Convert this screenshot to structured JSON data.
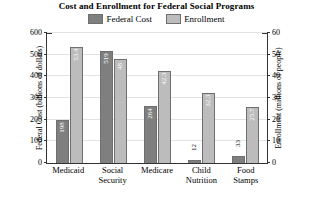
{
  "chart_data": {
    "type": "bar",
    "title": "Cost and Enrollment for Federal Social Programs",
    "categories": [
      "Medicaid",
      "Social Security",
      "Medicare",
      "Child Nutrition",
      "Food Stamps"
    ],
    "series": [
      {
        "name": "Federal Cost",
        "axis": "left",
        "color": "#7f7f7f",
        "values": [
          198,
          519,
          264,
          12,
          33
        ],
        "value_labels": [
          "198",
          "519",
          "264",
          "12",
          "33"
        ]
      },
      {
        "name": "Enrollment",
        "axis": "right",
        "color": "#bcbcbc",
        "values": [
          53.4,
          48,
          42.3,
          32.3,
          25.7
        ],
        "value_labels": [
          "53.4",
          "48",
          "42.3",
          "32.3",
          "25.7"
        ]
      }
    ],
    "xlabel": "",
    "ylabel": "Federal Cost (billions of dollars)",
    "y2label": "Enrollment (millions of people)",
    "ylim": [
      0,
      600
    ],
    "y2lim": [
      0,
      60
    ],
    "yticks": [
      "0",
      "100",
      "200",
      "300",
      "400",
      "500",
      "600"
    ],
    "y2ticks": [
      "0",
      "10",
      "20",
      "30",
      "40",
      "50",
      "60"
    ],
    "grid": true,
    "legend_position": "top-center"
  },
  "legend": {
    "entries": [
      {
        "label": "Federal Cost",
        "color": "#7f7f7f"
      },
      {
        "label": "Enrollment",
        "color": "#bcbcbc"
      }
    ]
  },
  "categories": [
    {
      "line1": "Medicaid",
      "line2": ""
    },
    {
      "line1": "Social",
      "line2": "Security"
    },
    {
      "line1": "Medicare",
      "line2": ""
    },
    {
      "line1": "Child",
      "line2": "Nutrition"
    },
    {
      "line1": "Food",
      "line2": "Stamps"
    }
  ]
}
